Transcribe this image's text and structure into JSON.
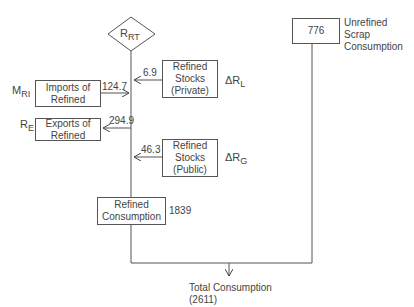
{
  "diagram": {
    "node_rrt": {
      "symbol": "R",
      "sub": "RT"
    },
    "private_stocks": {
      "line1": "Refined",
      "line2": "Stocks",
      "line3": "(Private)",
      "flow": "6.9",
      "symbol": "ΔR",
      "sub": "L"
    },
    "imports": {
      "line1": "Imports of",
      "line2": "Refined",
      "flow": "124.7",
      "symbol": "M",
      "sub": "RI"
    },
    "exports": {
      "line1": "Exports of",
      "line2": "Refined",
      "flow": "294.9",
      "symbol": "R",
      "sub": "E"
    },
    "public_stocks": {
      "line1": "Refined",
      "line2": "Stocks",
      "line3": "(Public)",
      "flow": "46.3",
      "symbol": "ΔR",
      "sub": "G"
    },
    "refined_consumption": {
      "line1": "Refined",
      "line2": "Consumption",
      "value": "1839"
    },
    "scrap": {
      "value": "776",
      "line1": "Unrefined",
      "line2": "Scrap",
      "line3": "Consumption"
    },
    "total": {
      "label": "Total Consumption",
      "value": "(2611)"
    }
  }
}
